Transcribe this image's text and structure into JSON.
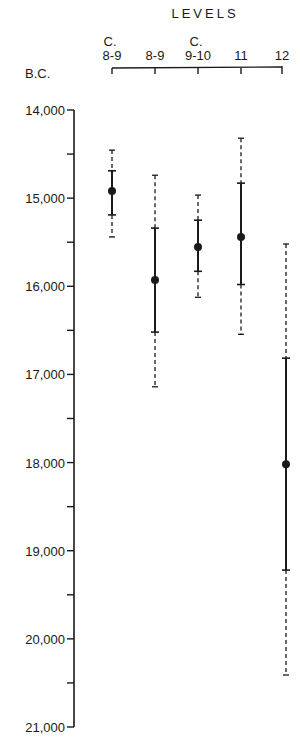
{
  "chart_data": {
    "type": "errorbar",
    "title": "LEVELS",
    "ylabel": "B.C.",
    "xlabel": "LEVELS",
    "y_inverted": true,
    "ylim": [
      14000,
      21000
    ],
    "y_ticks": [
      14000,
      15000,
      16000,
      17000,
      18000,
      19000,
      20000,
      21000
    ],
    "y_tick_labels": [
      "14,000",
      "15,000",
      "16,000",
      "17,000",
      "18,000",
      "19,000",
      "20,000",
      "21,000"
    ],
    "y_minor_tick_step": 500,
    "grid": false,
    "categories": [
      {
        "prefix": "C.",
        "label": "8-9"
      },
      {
        "prefix": "",
        "label": "8-9"
      },
      {
        "prefix": "C.",
        "label": "9-10"
      },
      {
        "prefix": "",
        "label": "11"
      },
      {
        "prefix": "",
        "label": "12"
      }
    ],
    "legend": "solid bar = inner range (1 sigma); dashed bar = outer range (2 sigma)",
    "series": [
      {
        "name": "C. 8-9",
        "value": 14920,
        "inner": [
          14690,
          15190
        ],
        "outer": [
          14455,
          15440
        ]
      },
      {
        "name": "8-9",
        "value": 15930,
        "inner": [
          15340,
          16520
        ],
        "outer": [
          14740,
          17140
        ]
      },
      {
        "name": "C. 9-10",
        "value": 15555,
        "inner": [
          15250,
          15830
        ],
        "outer": [
          14965,
          16125
        ]
      },
      {
        "name": "11",
        "value": 15440,
        "inner": [
          14830,
          15980
        ],
        "outer": [
          14320,
          16545
        ]
      },
      {
        "name": "12",
        "value": 18020,
        "inner": [
          16815,
          19220
        ],
        "outer": [
          15520,
          20410
        ]
      }
    ]
  },
  "header": {
    "title": "LEVELS",
    "unit": "B.C.",
    "prefix_c": "C."
  }
}
